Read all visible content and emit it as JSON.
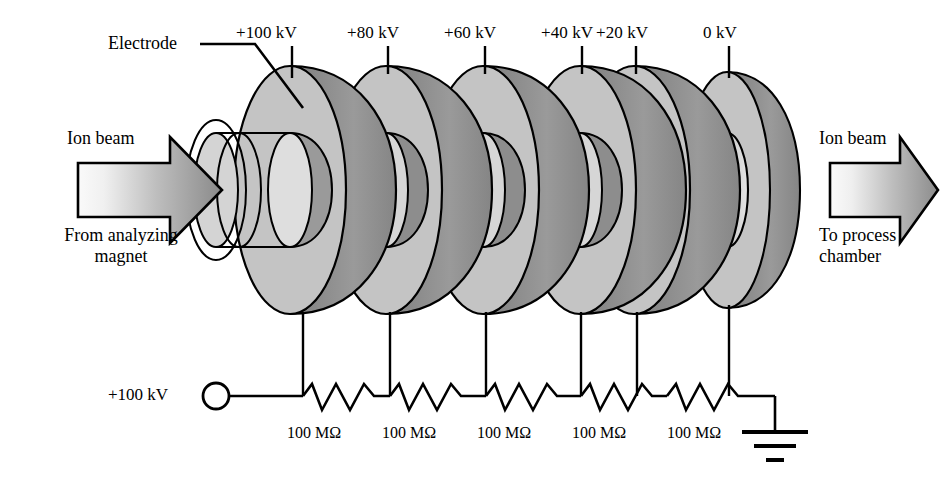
{
  "figure": {
    "background_color": "#ffffff",
    "line_color": "#000000"
  },
  "colors": {
    "electrode_face": "#c4c4c4",
    "electrode_rim": "#8e8e8e",
    "electrode_bore_dark": "#9a9a9a",
    "electrode_bore_light": "#d8d8d8",
    "outline": "#000000",
    "arrow_light": "#f2f2f2",
    "arrow_dark": "#8a8a8a"
  },
  "annotations": {
    "electrode_label": "Electrode"
  },
  "electrodes": [
    {
      "id": "e1",
      "voltage_label": "+100 kV",
      "cx": 290,
      "label_x": 292,
      "label_y": 24
    },
    {
      "id": "e2",
      "voltage_label": "+80 kV",
      "cx": 386,
      "label_x": 388,
      "label_y": 24
    },
    {
      "id": "e3",
      "voltage_label": "+60 kV",
      "cx": 483,
      "label_x": 485,
      "label_y": 24
    },
    {
      "id": "e4",
      "voltage_label": "+40 kV",
      "cx": 580,
      "label_x": 582,
      "label_y": 24
    },
    {
      "id": "e5",
      "voltage_label": "+20 kV",
      "cx": 634,
      "label_x": 636,
      "label_y": 24
    },
    {
      "id": "e6",
      "voltage_label": "0 kV",
      "cx": 727,
      "label_x": 729,
      "label_y": 24
    }
  ],
  "resistors": [
    {
      "id": "r1",
      "label": "100 MΩ",
      "x": 330
    },
    {
      "id": "r2",
      "label": "100 MΩ",
      "x": 425
    },
    {
      "id": "r3",
      "label": "100 MΩ",
      "x": 520
    },
    {
      "id": "r4",
      "label": "100 MΩ",
      "x": 615
    },
    {
      "id": "r5",
      "label": "100 MΩ",
      "x": 710
    }
  ],
  "supply": {
    "voltage_label": "+100 kV",
    "terminal_name": "open-circle-terminal"
  },
  "ground": {
    "symbol_name": "earth-ground-symbol"
  },
  "beam_in": {
    "title": "Ion beam",
    "source_line_1": "From analyzing",
    "source_line_2": "magnet",
    "direction": "right"
  },
  "beam_out": {
    "title": "Ion beam",
    "dest_line_1": "To process",
    "dest_line_2": "chamber",
    "direction": "right"
  }
}
